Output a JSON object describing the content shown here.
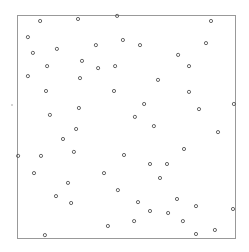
{
  "chart_data": {
    "type": "scatter",
    "title": "",
    "xlabel": "",
    "ylabel": "",
    "xlim": [
      0,
      1
    ],
    "ylim": [
      0,
      1
    ],
    "grid": false,
    "legend": null,
    "marker": "open-circle",
    "marker_color": "#555555",
    "frame_color": "#999999",
    "frame_px": {
      "left": 17,
      "top": 15,
      "right": 235,
      "bottom": 238
    },
    "series": [
      {
        "name": "points",
        "x": [
          0.106,
          0.28,
          0.459,
          0.89,
          0.05,
          0.486,
          0.362,
          0.564,
          0.867,
          0.183,
          0.073,
          0.739,
          0.298,
          0.45,
          0.138,
          0.372,
          0.789,
          0.05,
          0.289,
          0.647,
          0.133,
          0.445,
          0.789,
          0.583,
          0.995,
          0.284,
          0.835,
          0.151,
          0.541,
          0.628,
          0.271,
          0.922,
          0.211,
          0.766,
          0.261,
          0.491,
          0.005,
          0.11,
          0.61,
          0.688,
          0.078,
          0.399,
          0.656,
          0.234,
          0.463,
          0.179,
          0.734,
          0.555,
          0.248,
          0.821,
          0.991,
          0.61,
          0.693,
          0.537,
          0.761,
          0.417,
          0.908,
          0.821,
          0.128
        ],
        "y": [
          0.973,
          0.982,
          0.996,
          0.973,
          0.901,
          0.888,
          0.865,
          0.865,
          0.874,
          0.848,
          0.83,
          0.821,
          0.794,
          0.771,
          0.771,
          0.762,
          0.771,
          0.726,
          0.717,
          0.709,
          0.659,
          0.659,
          0.655,
          0.601,
          0.601,
          0.583,
          0.578,
          0.552,
          0.543,
          0.502,
          0.489,
          0.475,
          0.444,
          0.399,
          0.386,
          0.372,
          0.368,
          0.368,
          0.332,
          0.332,
          0.291,
          0.291,
          0.269,
          0.247,
          0.215,
          0.188,
          0.175,
          0.161,
          0.157,
          0.143,
          0.13,
          0.121,
          0.112,
          0.076,
          0.076,
          0.054,
          0.036,
          0.018,
          0.013
        ]
      }
    ],
    "annotations": [
      {
        "type": "stray-mark",
        "px": [
          12,
          105
        ]
      }
    ]
  }
}
